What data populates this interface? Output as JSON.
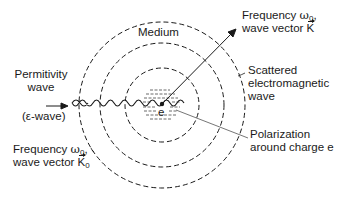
{
  "diagram": {
    "type": "physics-schematic",
    "colors": {
      "ink": "#1a1a1a",
      "background": "#ffffff",
      "pointer": "#555555"
    },
    "center_charge": {
      "symbol": "e"
    },
    "labels": {
      "medium": "Medium",
      "permittivity_wave_line1": "Permitivity",
      "permittivity_wave_line2": "wave",
      "epsilon_wave": "(ε-wave)",
      "incident_freq_prefix": "Frequency ",
      "incident_omega": "ω",
      "incident_omega_sub": "0",
      "incident_comma": ",",
      "incident_vector_prefix": "wave vector ",
      "incident_vector_symbol": "K",
      "incident_vector_sub": "0",
      "scattered_freq_prefix": "Frequency ",
      "scattered_omega": "ω",
      "scattered_omega_sub": "0",
      "scattered_comma": ",",
      "scattered_vector_prefix": "wave vector ",
      "scattered_vector_symbol": "K",
      "scattered_line1": "Scattered",
      "scattered_line2": "electromagnetic",
      "scattered_line3": "wave",
      "polarization_line1": "Polarization",
      "polarization_line2": "around charge e"
    },
    "elements": [
      "three concentric dashed circles (scattered wavefronts)",
      "wavy incident permittivity wave with arrow from left",
      "shaded polarization cloud around charge e",
      "arrow showing scattered wave vector K",
      "leader lines to labels"
    ]
  }
}
